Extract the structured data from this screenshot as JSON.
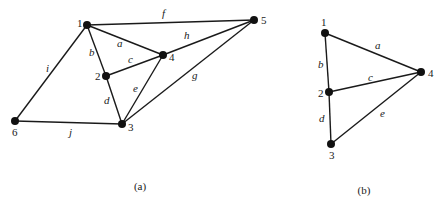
{
  "figures": [
    {
      "id": "a",
      "caption": "(a)",
      "caption_pos": [
        140,
        190
      ],
      "vertices": [
        {
          "label": "1",
          "x": 87,
          "y": 25,
          "lx": 77,
          "ly": 27
        },
        {
          "label": "2",
          "x": 106,
          "y": 76,
          "lx": 95,
          "ly": 80
        },
        {
          "label": "3",
          "x": 122,
          "y": 124,
          "lx": 128,
          "ly": 131
        },
        {
          "label": "4",
          "x": 163,
          "y": 55,
          "lx": 169,
          "ly": 61
        },
        {
          "label": "5",
          "x": 254,
          "y": 20,
          "lx": 261,
          "ly": 24
        },
        {
          "label": "6",
          "x": 15,
          "y": 121,
          "lx": 12,
          "ly": 136
        }
      ],
      "edges": [
        {
          "label": "a",
          "from": "1",
          "to": "4",
          "lx": 117,
          "ly": 47
        },
        {
          "label": "b",
          "from": "1",
          "to": "2",
          "lx": 89,
          "ly": 56
        },
        {
          "label": "c",
          "from": "2",
          "to": "4",
          "lx": 128,
          "ly": 63
        },
        {
          "label": "d",
          "from": "2",
          "to": "3",
          "lx": 104,
          "ly": 104
        },
        {
          "label": "e",
          "from": "4",
          "to": "3",
          "lx": 133,
          "ly": 92
        },
        {
          "label": "f",
          "from": "1",
          "to": "5",
          "lx": 162,
          "ly": 17
        },
        {
          "label": "g",
          "from": "3",
          "to": "5",
          "lx": 192,
          "ly": 79
        },
        {
          "label": "h",
          "from": "4",
          "to": "5",
          "lx": 184,
          "ly": 39
        },
        {
          "label": "i",
          "from": "1",
          "to": "6",
          "lx": 46,
          "ly": 72
        },
        {
          "label": "j",
          "from": "6",
          "to": "3",
          "lx": 69,
          "ly": 136
        }
      ]
    },
    {
      "id": "b",
      "caption": "(b)",
      "caption_pos": [
        364,
        194
      ],
      "vertices": [
        {
          "label": "1",
          "x": 325,
          "y": 33,
          "lx": 321,
          "ly": 26
        },
        {
          "label": "2",
          "x": 329,
          "y": 92,
          "lx": 318,
          "ly": 97
        },
        {
          "label": "3",
          "x": 331,
          "y": 144,
          "lx": 329,
          "ly": 159
        },
        {
          "label": "4",
          "x": 421,
          "y": 72,
          "lx": 428,
          "ly": 77
        }
      ],
      "edges": [
        {
          "label": "a",
          "from": "1",
          "to": "4",
          "lx": 375,
          "ly": 49
        },
        {
          "label": "b",
          "from": "1",
          "to": "2",
          "lx": 318,
          "ly": 68
        },
        {
          "label": "c",
          "from": "2",
          "to": "4",
          "lx": 368,
          "ly": 81
        },
        {
          "label": "d",
          "from": "2",
          "to": "3",
          "lx": 319,
          "ly": 122
        },
        {
          "label": "e",
          "from": "3",
          "to": "4",
          "lx": 380,
          "ly": 117
        }
      ]
    }
  ]
}
